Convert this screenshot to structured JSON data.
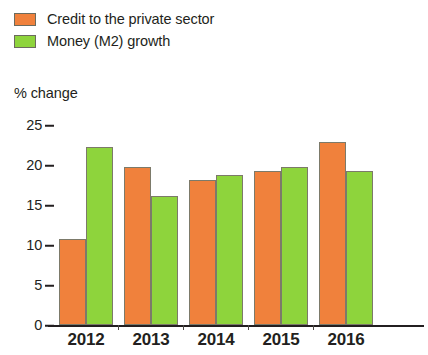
{
  "legend": {
    "items": [
      {
        "label": "Credit to the private sector",
        "color": "#f0813c",
        "swatch_name": "legend-swatch-credit"
      },
      {
        "label": "Money (M2) growth",
        "color": "#8ed43c",
        "swatch_name": "legend-swatch-money"
      }
    ]
  },
  "axis": {
    "y_title": "% change",
    "y_ticks": [
      "0",
      "5",
      "10",
      "15",
      "20",
      "25"
    ],
    "x_labels": [
      "2012",
      "2013",
      "2014",
      "2015",
      "2016"
    ]
  },
  "chart_data": {
    "type": "bar",
    "title": "",
    "subtitle": "",
    "xlabel": "",
    "ylabel": "% change",
    "ylim": [
      0,
      25
    ],
    "yticks": [
      0,
      5,
      10,
      15,
      20,
      25
    ],
    "grid": false,
    "legend_position": "top-left",
    "categories": [
      "2012",
      "2013",
      "2014",
      "2015",
      "2016"
    ],
    "series": [
      {
        "name": "Credit to the private sector",
        "color": "#f0813c",
        "values": [
          10.8,
          19.7,
          18.1,
          19.2,
          22.9
        ]
      },
      {
        "name": "Money (M2) growth",
        "color": "#8ed43c",
        "values": [
          22.2,
          16.1,
          18.8,
          19.7,
          19.3
        ]
      }
    ]
  }
}
